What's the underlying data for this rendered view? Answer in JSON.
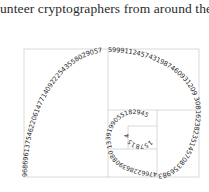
{
  "caption": {
    "text": "unteer cryptographers from around the"
  },
  "figure": {
    "type": "fibonacci-spiral-of-digits",
    "frame_color": "#cfcfcf",
    "text_color": "#2b2b2b",
    "spiral_segments": [
      {
        "name": "outer-left-arc",
        "digits": "968696137546220614771409222543558029057"
      },
      {
        "name": "top-right-arc",
        "digits": "5999112457431987460931209 308"
      },
      {
        "name": "right-arc",
        "digits": "162382351457083569831"
      },
      {
        "name": "bottom-arc",
        "digits": "47662286390880"
      },
      {
        "name": "inner-left-arc",
        "digits": "1339199055182945"
      },
      {
        "name": "innermost-arc",
        "digits": "157815 4"
      }
    ]
  }
}
